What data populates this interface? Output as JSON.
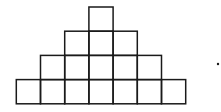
{
  "diagram": {
    "type": "square-pyramid",
    "rows": [
      {
        "row": 1,
        "cells": 1
      },
      {
        "row": 2,
        "cells": 3
      },
      {
        "row": 3,
        "cells": 5
      },
      {
        "row": 4,
        "cells": 7
      }
    ],
    "total_cells": 16,
    "trailing_mark": "period-dot",
    "colors": {
      "stroke": "#1a1a1a",
      "background": "#ffffff"
    }
  }
}
